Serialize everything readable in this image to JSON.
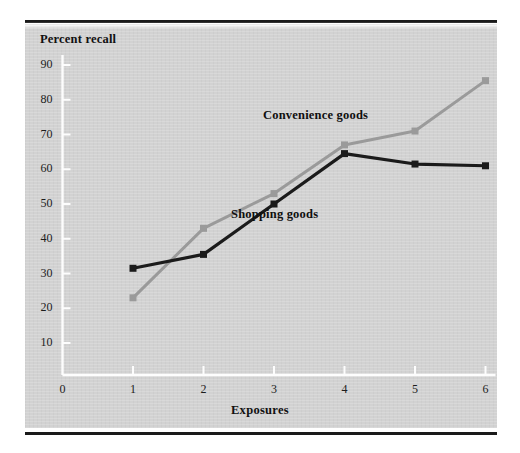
{
  "figure": {
    "panel_color": "#d2d2d2",
    "rule_color": "#1a1a1a"
  },
  "chart_data": {
    "type": "line",
    "title": "",
    "ylabel": "Percent recall",
    "xlabel": "Exposures",
    "x": [
      1,
      2,
      3,
      4,
      5,
      6
    ],
    "xticks": [
      "0",
      "1",
      "2",
      "3",
      "4",
      "5",
      "6"
    ],
    "xtick_values": [
      0,
      1,
      2,
      3,
      4,
      5,
      6
    ],
    "yticks": [
      "10",
      "20",
      "30",
      "40",
      "50",
      "60",
      "70",
      "80",
      "90"
    ],
    "ytick_values": [
      10,
      20,
      30,
      40,
      50,
      60,
      70,
      80,
      90
    ],
    "xlim": [
      0,
      6
    ],
    "ylim": [
      0,
      90
    ],
    "grid": false,
    "legend_position": "inline-annotation",
    "series": [
      {
        "name": "Convenience goods",
        "color": "#9a9a9a",
        "marker": "square",
        "values": [
          23,
          43,
          53,
          67,
          71,
          85.5
        ]
      },
      {
        "name": "Shopping goods",
        "color": "#1b1b1b",
        "marker": "square",
        "values": [
          31.5,
          35.5,
          50,
          64.5,
          61.5,
          61
        ]
      }
    ],
    "annotations": [
      {
        "text": "Convenience goods",
        "x": 3.7,
        "y": 75
      },
      {
        "text": "Shopping goods",
        "x": 3.2,
        "y": 47
      }
    ]
  }
}
